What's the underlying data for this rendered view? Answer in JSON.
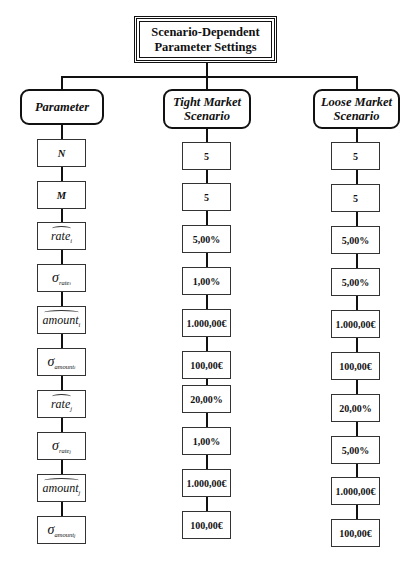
{
  "title": "Scenario-Dependent Parameter Settings",
  "title_lines": [
    "Scenario-Dependent",
    "Parameter Settings"
  ],
  "columns": [
    {
      "header": "Parameter",
      "header_lines": [
        "Parameter"
      ]
    },
    {
      "header": "Tight Market Scenario",
      "header_lines": [
        "Tight Market",
        "Scenario"
      ]
    },
    {
      "header": "Loose Market Scenario",
      "header_lines": [
        "Loose Market",
        "Scenario"
      ]
    }
  ],
  "parameters": [
    {
      "symbol": "N",
      "type": "plain"
    },
    {
      "symbol": "M",
      "type": "plain"
    },
    {
      "symbol": "rate",
      "sub": "i",
      "type": "hat"
    },
    {
      "symbol": "σ",
      "sub": "rate",
      "subsub": "i",
      "type": "sigma"
    },
    {
      "symbol": "amount",
      "sub": "i",
      "type": "hat"
    },
    {
      "symbol": "σ",
      "sub": "amount",
      "subsub": "i",
      "type": "sigma"
    },
    {
      "symbol": "rate",
      "sub": "j",
      "type": "hat"
    },
    {
      "symbol": "σ",
      "sub": "rate",
      "subsub": "j",
      "type": "sigma"
    },
    {
      "symbol": "amount",
      "sub": "j",
      "type": "hat"
    },
    {
      "symbol": "σ",
      "sub": "amount",
      "subsub": "j",
      "type": "sigma"
    }
  ],
  "tight_values": [
    "5",
    "5",
    "5,00%",
    "1,00%",
    "1.000,00€",
    "100,00€",
    "20,00%",
    "1,00%",
    "1.000,00€",
    "100,00€"
  ],
  "loose_values": [
    "5",
    "5",
    "5,00%",
    "5,00%",
    "1.000,00€",
    "100,00€",
    "20,00%",
    "5,00%",
    "1.000,00€",
    "100,00€"
  ]
}
